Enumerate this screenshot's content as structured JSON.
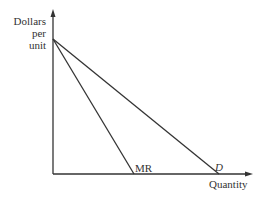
{
  "diagram": {
    "y_axis_label_lines": [
      "Dollars",
      "per",
      "unit"
    ],
    "x_axis_label": "Quantity",
    "curves": [
      {
        "name": "MR",
        "label": "MR",
        "from": [
          53,
          39
        ],
        "to": [
          134,
          174
        ]
      },
      {
        "name": "D",
        "label": "D",
        "from": [
          53,
          39
        ],
        "to": [
          219,
          174
        ]
      }
    ],
    "colors": {
      "line": "#333333",
      "text": "#333333"
    }
  }
}
